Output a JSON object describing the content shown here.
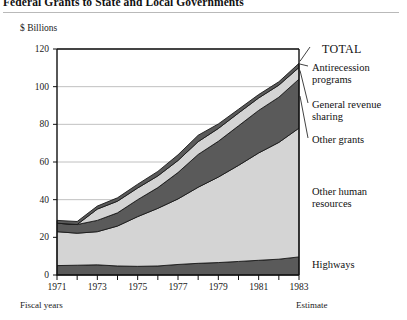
{
  "figure": {
    "title": "Federal Grants to State and Local Governments",
    "unit_label": "$ Billions",
    "footnote_left": "Fiscal years",
    "footnote_right": "Estimate"
  },
  "labels": {
    "total": "TOTAL",
    "antirecession": "Antirecession\nprograms",
    "general_revenue_sharing": "General revenue\nsharing",
    "other_grants": "Other grants",
    "other_human_resources": "Other human\nresources",
    "highways": "Highways"
  },
  "colors": {
    "dark_band": "#5a5a5a",
    "light_band": "#d4d4d4",
    "outline": "#1a1a1a",
    "gridline": "#b0b0b0",
    "axis": "#111111",
    "background": "#ffffff"
  },
  "chart_data": {
    "type": "area",
    "title": "Federal Grants to State and Local Governments",
    "subtitle": "$ Billions",
    "xlabel": "Fiscal years",
    "ylabel": "$ Billions",
    "xlim": [
      1971,
      1983
    ],
    "ylim": [
      0,
      120
    ],
    "yticks": [
      0,
      20,
      40,
      60,
      80,
      100,
      120
    ],
    "ytick_labels": [
      "0",
      "20",
      "40",
      "60",
      "80",
      "100",
      "120"
    ],
    "xticks": [
      1971,
      1972,
      1973,
      1974,
      1975,
      1976,
      1977,
      1978,
      1979,
      1980,
      1981,
      1982,
      1983
    ],
    "xtick_labels": [
      "1971",
      "",
      "1973",
      "",
      "1975",
      "",
      "1977",
      "",
      "1979",
      "",
      "1981",
      "",
      "1983"
    ],
    "grid": "horizontal",
    "stacked": true,
    "legend_position": "right-inline-annotations",
    "x": [
      1971,
      1972,
      1973,
      1974,
      1975,
      1976,
      1977,
      1978,
      1979,
      1980,
      1981,
      1982,
      1983
    ],
    "series": [
      {
        "name": "Highways",
        "fill": "dark",
        "values": [
          5.0,
          5.2,
          5.4,
          4.8,
          4.6,
          4.8,
          5.6,
          6.2,
          6.6,
          7.2,
          7.8,
          8.4,
          9.6
        ]
      },
      {
        "name": "Other human resources",
        "fill": "light",
        "values": [
          18.0,
          17.0,
          17.6,
          21.2,
          26.4,
          30.6,
          34.8,
          40.4,
          45.4,
          51.0,
          57.0,
          62.0,
          68.4
        ]
      },
      {
        "name": "Other grants",
        "fill": "dark",
        "values": [
          4.5,
          4.6,
          6.0,
          7.0,
          9.0,
          11.0,
          14.0,
          17.4,
          19.0,
          21.0,
          22.6,
          24.0,
          26.0
        ]
      },
      {
        "name": "General revenue sharing",
        "fill": "light",
        "values": [
          0.0,
          0.0,
          6.0,
          6.2,
          6.2,
          6.2,
          6.4,
          6.8,
          6.8,
          6.8,
          6.6,
          6.4,
          6.2
        ]
      },
      {
        "name": "Antirecession programs",
        "fill": "dark",
        "values": [
          1.5,
          1.6,
          1.6,
          1.8,
          2.0,
          2.4,
          3.0,
          3.4,
          2.4,
          2.0,
          1.8,
          1.8,
          2.2
        ]
      }
    ],
    "totals": [
      29.0,
      28.4,
      36.6,
      41.0,
      48.2,
      55.0,
      63.8,
      74.2,
      80.2,
      88.0,
      95.8,
      102.6,
      112.4
    ]
  }
}
